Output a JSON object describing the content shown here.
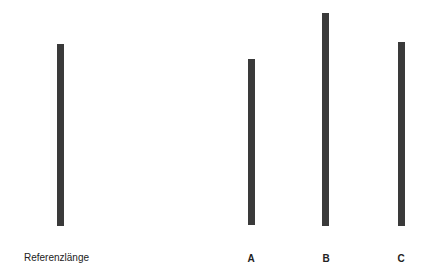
{
  "diagram": {
    "type": "line-length-comparison",
    "reference": {
      "label": "Referenzlänge",
      "x": 57,
      "top": 44,
      "bottom": 226
    },
    "comparisons": [
      {
        "label": "A",
        "x": 248,
        "top": 59,
        "bottom": 225
      },
      {
        "label": "B",
        "x": 322,
        "top": 13,
        "bottom": 226
      },
      {
        "label": "C",
        "x": 398,
        "top": 42,
        "bottom": 226
      }
    ],
    "line_color": "#3a3a3a"
  }
}
